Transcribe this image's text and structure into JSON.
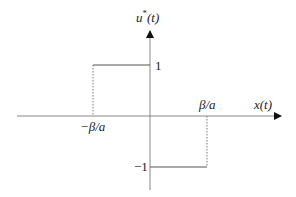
{
  "diagram": {
    "type": "signum-control-plot",
    "y_axis_label_base": "u",
    "y_axis_label_sup": "*",
    "y_axis_label_arg": "(t)",
    "x_axis_label": "x(t)",
    "tick_pos_y": "1",
    "tick_neg_y": "−1",
    "tick_pos_x": "β/a",
    "tick_neg_x": "−β/a",
    "colors": {
      "axis": "#888888",
      "line": "#555555",
      "text": "#222222"
    }
  }
}
